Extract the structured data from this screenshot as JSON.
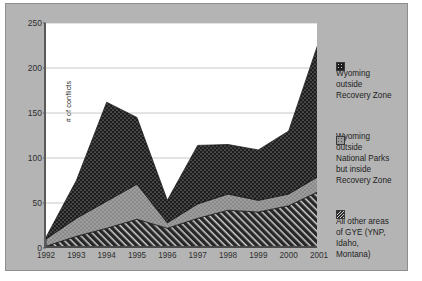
{
  "chart_data": {
    "type": "area",
    "stacked": true,
    "title": "",
    "xlabel": "",
    "ylabel": "# of conflicts",
    "categories": [
      "1992",
      "1993",
      "1994",
      "1995",
      "1996",
      "1997",
      "1998",
      "1999",
      "2000",
      "2001"
    ],
    "ylim": [
      0,
      250
    ],
    "yticks": [
      0,
      50,
      100,
      150,
      200,
      250
    ],
    "grid": true,
    "legend_position": "right",
    "series": [
      {
        "name": "All other areas of GYE (YNP, Idaho, Montana)",
        "swatch": "hatch-dark",
        "color": "#2b2b2b",
        "values": [
          2,
          13,
          22,
          32,
          22,
          33,
          42,
          40,
          47,
          63
        ]
      },
      {
        "name": "Wyoming outside National Parks but inside Recovery Zone",
        "swatch": "dotted-gray",
        "color": "#9a9a9a",
        "values": [
          8,
          20,
          30,
          39,
          6,
          16,
          18,
          13,
          13,
          17
        ]
      },
      {
        "name": "Wyoming outside Recovery Zone",
        "swatch": "dotted-dark",
        "color": "#1d1d1d",
        "values": [
          2,
          42,
          110,
          74,
          25,
          65,
          55,
          56,
          70,
          150
        ]
      }
    ],
    "totals": [
      12,
      75,
      162,
      145,
      53,
      114,
      115,
      109,
      130,
      230
    ]
  },
  "legend": {
    "items": [
      {
        "swatch": "dotted-dark",
        "lines": [
          "Wyoming",
          "outside",
          "Recovery Zone"
        ]
      },
      {
        "swatch": "dotted-gray",
        "lines": [
          "Wyoming",
          "outside",
          "National Parks",
          "but inside",
          "Recovery Zone"
        ]
      },
      {
        "swatch": "hatch-dark",
        "lines": [
          "All other areas",
          "of GYE (YNP,",
          "Idaho,",
          "Montana)"
        ]
      }
    ]
  }
}
